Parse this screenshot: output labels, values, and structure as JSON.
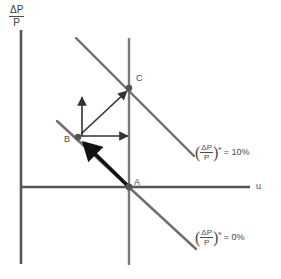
{
  "figure": {
    "type": "economics-diagram"
  },
  "axes": {
    "y_label": {
      "numerator": "ΔP",
      "denominator": "P"
    },
    "x_label": "u"
  },
  "points": [
    {
      "id": "A",
      "label": "A",
      "x": 129,
      "y": 187
    },
    {
      "id": "B",
      "label": "B",
      "x": 78,
      "y": 137
    },
    {
      "id": "C",
      "label": "C",
      "x": 129,
      "y": 88
    }
  ],
  "curves": [
    {
      "id": "pc-10",
      "label_prefix": "(",
      "label_numerator": "ΔP",
      "label_denominator": "P",
      "label_suffix": ")",
      "label_superscript": "e",
      "label_equals": "= 10%",
      "full_label": "(ΔP/P)e = 10%"
    },
    {
      "id": "pc-0",
      "label_prefix": "(",
      "label_numerator": "ΔP",
      "label_denominator": "P",
      "label_suffix": ")",
      "label_superscript": "e",
      "label_equals": "= 0%",
      "full_label": "(ΔP/P)e = 0%"
    }
  ],
  "arrows": [
    {
      "id": "arrow-b-up",
      "from": "B",
      "direction": "up"
    },
    {
      "id": "arrow-b-right",
      "from": "B",
      "direction": "right"
    },
    {
      "id": "arrow-b-to-c",
      "from": "B",
      "to": "C",
      "direction": "up-right"
    },
    {
      "id": "arrow-a-to-b",
      "from": "A",
      "to": "B",
      "direction": "up-left",
      "style": "thick"
    }
  ],
  "colors": {
    "axis": "#555555",
    "curve": "#666666",
    "point": "#555555",
    "arrow": "#333333",
    "thick_arrow": "#111111",
    "text": "#4a4a4a",
    "background": "#ffffff"
  }
}
